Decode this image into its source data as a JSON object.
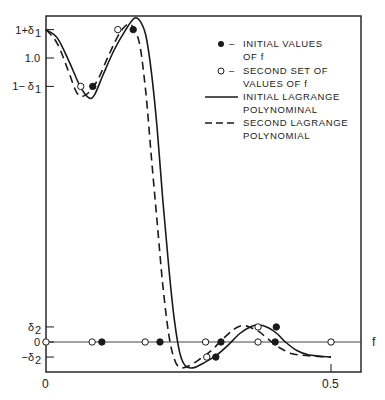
{
  "chart_data": {
    "type": "line",
    "title": "",
    "xlabel": "f",
    "ylabel": "",
    "xlim": [
      0,
      0.55
    ],
    "ylim": [
      -0.105,
      1.145
    ],
    "grid": false,
    "legend_position": "upper right (inside)",
    "x_ticks": [
      {
        "value": 0,
        "label": "0"
      },
      {
        "value": 0.5,
        "label": "0.5"
      }
    ],
    "y_ticks": [
      {
        "value": 1.1,
        "label": "1+δ₁",
        "text": "1+δ",
        "sub": "1"
      },
      {
        "value": 1.0,
        "label": "1.0",
        "text": "1.0",
        "sub": ""
      },
      {
        "value": 0.9,
        "label": "1−δ₁",
        "text": "1− δ",
        "sub": "1"
      },
      {
        "value": 0.053,
        "label": "δ₂",
        "text": "δ",
        "sub": "2"
      },
      {
        "value": 0,
        "label": "0",
        "text": "0",
        "sub": ""
      },
      {
        "value": -0.053,
        "label": "−δ₂",
        "text": "−δ",
        "sub": "2"
      }
    ],
    "series": [
      {
        "name": "INITIAL LAGRANGE POLYNOMINAL",
        "style": "solid",
        "points": [
          [
            0,
            1.1
          ],
          [
            0.02,
            1.07
          ],
          [
            0.04,
            0.99
          ],
          [
            0.06,
            0.9
          ],
          [
            0.075,
            0.86
          ],
          [
            0.085,
            0.87
          ],
          [
            0.1,
            0.94
          ],
          [
            0.12,
            1.03
          ],
          [
            0.14,
            1.1
          ],
          [
            0.155,
            1.14
          ],
          [
            0.165,
            1.13
          ],
          [
            0.175,
            1.08
          ],
          [
            0.185,
            0.95
          ],
          [
            0.195,
            0.75
          ],
          [
            0.205,
            0.5
          ],
          [
            0.215,
            0.27
          ],
          [
            0.225,
            0.08
          ],
          [
            0.235,
            -0.04
          ],
          [
            0.245,
            -0.085
          ],
          [
            0.26,
            -0.09
          ],
          [
            0.28,
            -0.07
          ],
          [
            0.3,
            -0.045
          ],
          [
            0.32,
            -0.01
          ],
          [
            0.34,
            0.03
          ],
          [
            0.36,
            0.055
          ],
          [
            0.375,
            0.06
          ],
          [
            0.39,
            0.05
          ],
          [
            0.405,
            0.03
          ],
          [
            0.42,
            0.0
          ],
          [
            0.44,
            -0.03
          ],
          [
            0.46,
            -0.045
          ],
          [
            0.48,
            -0.05
          ],
          [
            0.5,
            -0.053
          ]
        ]
      },
      {
        "name": "SECOND LAGRANGE POLYNOMIAL",
        "style": "dashed",
        "points": [
          [
            0,
            1.1
          ],
          [
            0.02,
            1.05
          ],
          [
            0.04,
            0.95
          ],
          [
            0.055,
            0.875
          ],
          [
            0.07,
            0.87
          ],
          [
            0.09,
            0.92
          ],
          [
            0.11,
            1.01
          ],
          [
            0.13,
            1.09
          ],
          [
            0.145,
            1.12
          ],
          [
            0.155,
            1.1
          ],
          [
            0.165,
            1.04
          ],
          [
            0.175,
            0.88
          ],
          [
            0.185,
            0.65
          ],
          [
            0.195,
            0.42
          ],
          [
            0.205,
            0.2
          ],
          [
            0.215,
            0.03
          ],
          [
            0.225,
            -0.06
          ],
          [
            0.235,
            -0.09
          ],
          [
            0.25,
            -0.085
          ],
          [
            0.27,
            -0.06
          ],
          [
            0.29,
            -0.03
          ],
          [
            0.31,
            0.01
          ],
          [
            0.33,
            0.045
          ],
          [
            0.345,
            0.058
          ],
          [
            0.36,
            0.05
          ],
          [
            0.375,
            0.035
          ],
          [
            0.39,
            0.01
          ],
          [
            0.41,
            -0.02
          ],
          [
            0.43,
            -0.04
          ],
          [
            0.45,
            -0.047
          ],
          [
            0.47,
            -0.05
          ],
          [
            0.5,
            -0.053
          ]
        ]
      }
    ],
    "markers": {
      "initial_values": [
        [
          0.0,
          0.0
        ],
        [
          0.082,
          0.9
        ],
        [
          0.153,
          1.1
        ],
        [
          0.098,
          0.0
        ],
        [
          0.2,
          0.0
        ],
        [
          0.307,
          0.0
        ],
        [
          0.298,
          -0.053
        ],
        [
          0.402,
          0.0
        ],
        [
          0.404,
          0.053
        ],
        [
          0.5,
          0.0
        ]
      ],
      "second_set_values": [
        [
          0.0,
          0.0
        ],
        [
          0.061,
          0.9
        ],
        [
          0.126,
          1.1
        ],
        [
          0.081,
          0.0
        ],
        [
          0.174,
          0.0
        ],
        [
          0.28,
          0.0
        ],
        [
          0.282,
          -0.053
        ],
        [
          0.372,
          0.0
        ],
        [
          0.372,
          0.053
        ],
        [
          0.5,
          0.0
        ]
      ]
    }
  },
  "legend": {
    "items": [
      {
        "symbol": "filled-circle",
        "line1": "INITIAL  VALUES",
        "line2": "OF  f"
      },
      {
        "symbol": "open-circle",
        "line1": "SECOND  SET  OF",
        "line2": "VALUES  OF  f"
      },
      {
        "symbol": "solid-line",
        "line1": "INITIAL  LAGRANGE",
        "line2": "POLYNOMINAL"
      },
      {
        "symbol": "dashed-line",
        "line1": "SECOND  LAGRANGE",
        "line2": "POLYNOMIAL"
      }
    ],
    "dash": "–"
  },
  "axes": {
    "x_origin_label": "0",
    "x_half_label": "0.5",
    "x_axis_name": "f"
  },
  "colors": {
    "ink": "#1a1a1a",
    "background": "#ffffff"
  }
}
